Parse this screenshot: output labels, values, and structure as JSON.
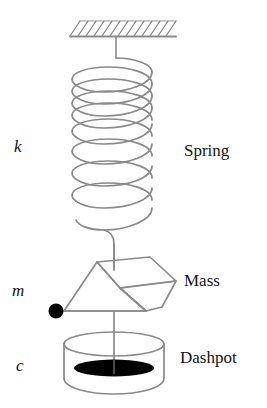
{
  "diagram": {
    "background_color": "#ffffff",
    "line_color": "#8a8a8a",
    "fill_color": "#000000",
    "text_color": "#141414",
    "variables": {
      "stiffness": "k",
      "mass": "m",
      "damping": "c"
    },
    "parts": {
      "spring": "Spring",
      "mass": "Mass",
      "dashpot": "Dashpot"
    },
    "icons": {
      "ceiling": "hatched-ground-support-icon",
      "spring": "helical-spring-icon",
      "mass": "parallelepiped-block-icon",
      "dashpot": "damper-cylinder-icon",
      "pivot": "filled-node-dot-icon",
      "rod": "connecting-rod-icon"
    },
    "geometry": {
      "ceiling_y": 36,
      "ceiling_x1": 70,
      "ceiling_x2": 176,
      "hatch_count": 13,
      "spring_coils": 8,
      "spring_top_y": 62,
      "spring_bottom_y": 238,
      "spring_left_x": 72,
      "spring_right_x": 152,
      "mass_top_y": 257,
      "mass_bottom_y": 313,
      "dashpot_top_y": 338,
      "dashpot_bottom_y": 392,
      "axis_x": 114
    }
  }
}
